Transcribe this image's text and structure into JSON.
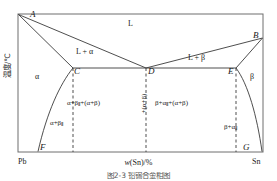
{
  "figure": {
    "kind": "binary-eutectic-phase-diagram",
    "caption": "图2-3  铅锡合金相图",
    "axes": {
      "y_title": "温度/℃",
      "x_title_italic": "w",
      "x_title_rest": "(Sn)/%",
      "x_left_endpoint": "Pb",
      "x_right_endpoint": "Sn"
    },
    "points": [
      {
        "id": "A",
        "label": "A",
        "x": 30,
        "y": 14
      },
      {
        "id": "B",
        "label": "B",
        "x": 263,
        "y": 38
      },
      {
        "id": "C",
        "label": "C",
        "x": 73,
        "y": 68
      },
      {
        "id": "D",
        "label": "D",
        "x": 146,
        "y": 68
      },
      {
        "id": "E",
        "label": "E",
        "x": 236,
        "y": 68
      },
      {
        "id": "F",
        "label": "F",
        "x": 38,
        "y": 152
      },
      {
        "id": "G",
        "label": "G",
        "x": 252,
        "y": 152
      }
    ],
    "phase_fields": [
      {
        "id": "liquid",
        "label": "L"
      },
      {
        "id": "liquid-plus-alpha",
        "label": "L + α"
      },
      {
        "id": "liquid-plus-beta",
        "label": "L + β"
      },
      {
        "id": "alpha",
        "label": "α"
      },
      {
        "id": "beta",
        "label": "β"
      },
      {
        "id": "alpha-plus-beta2",
        "label_main": "α+β",
        "label_sub": "Ⅱ"
      },
      {
        "id": "beta-plus-alpha2",
        "label_main": "β+α",
        "label_sub": "Ⅱ"
      },
      {
        "id": "mid-left",
        "label_a": "α+β",
        "label_sub": "Ⅱ",
        "label_b": "+(α+β)"
      },
      {
        "id": "mid-right",
        "label_a": "β+α",
        "label_sub": "Ⅱ",
        "label_b": "+(α+β)"
      },
      {
        "id": "mid-vertical",
        "label": "+(α+β)"
      }
    ],
    "curves": {
      "liquidus_left": "A→D",
      "liquidus_right": "B→D",
      "solidus_left": "A→C",
      "solidus_right": "B→E",
      "eutectic_line": "C—D—E",
      "solvus_left": "C→F",
      "solvus_right": "E→G"
    },
    "dashed_verticals": [
      "C→bottom",
      "D→bottom",
      "E→bottom"
    ],
    "colors": {
      "line": "#3a3a3a",
      "frame": "#6e6e6e",
      "background": "#ffffff"
    }
  }
}
